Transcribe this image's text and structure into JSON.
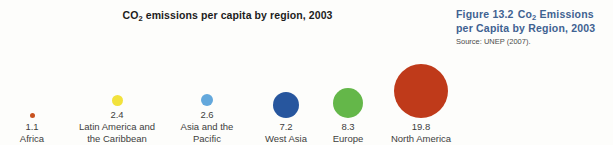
{
  "chart": {
    "title_prefix": "CO",
    "title_sub": "2",
    "title_rest": " emissions per capita by region, 2003"
  },
  "caption": {
    "figure_number": "Figure 13.2",
    "title_prefix": "Co",
    "title_sub": "2",
    "title_rest": " Emissions per Capita by Region, 2003",
    "source": "Source: UNEP (2007).",
    "accent_color": "#3f6291"
  },
  "chart_data": {
    "type": "scatter",
    "title": "CO2 emissions per capita by region, 2003",
    "xlabel": "",
    "ylabel": "",
    "categories": [
      "Africa",
      "Latin America and\nthe Caribbean",
      "Asia and the\nPacific",
      "West Asia",
      "Europe",
      "North America"
    ],
    "values": [
      1.1,
      2.4,
      2.6,
      7.2,
      8.3,
      19.8
    ],
    "value_labels": [
      "1.1",
      "2.4",
      "2.6",
      "7.2",
      "8.3",
      "19.8"
    ],
    "colors": [
      "#c8521f",
      "#f2e23c",
      "#63a8dc",
      "#27569e",
      "#64b749",
      "#bf3a1a"
    ],
    "bubble_diameters_px": [
      5,
      11,
      12,
      26,
      30,
      54
    ],
    "column_centers_px": [
      32,
      117,
      207,
      286,
      348,
      421
    ],
    "legend": "none",
    "grid": false
  }
}
